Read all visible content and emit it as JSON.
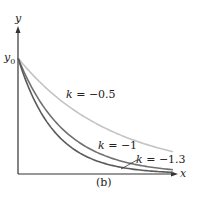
{
  "chart_data": {
    "type": "line",
    "title": "",
    "caption": "(b)",
    "xlabel": "x",
    "ylabel": "y",
    "y_intercept_label": "y0",
    "function": "y = y0 * exp(k*x)",
    "x_range": [
      0,
      3.3
    ],
    "ylim": [
      0,
      1
    ],
    "grid": false,
    "legend": "inline labels",
    "series": [
      {
        "name": "k = −0.5",
        "k": -0.5,
        "color": "#c4c4c4",
        "label_text": "k = −0.5"
      },
      {
        "name": "k = −1",
        "k": -1.0,
        "color": "#707070",
        "label_text": "k = −1"
      },
      {
        "name": "k = −1.3",
        "k": -1.3,
        "color": "#5a5a5a",
        "label_text": "k = −1.3"
      }
    ]
  },
  "labels": {
    "x_axis": "x",
    "y_axis": "y",
    "y0_main": "y",
    "y0_sub": "0",
    "caption": "(b)",
    "k1_pre": "k",
    "k1_post": " = −0.5",
    "k2_pre": "k",
    "k2_post": " = −1",
    "k3_pre": "k",
    "k3_post": " = −1.3"
  }
}
